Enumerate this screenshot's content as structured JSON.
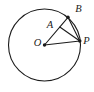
{
  "figure": {
    "type": "geometry-diagram",
    "background": "#ffffff",
    "stroke_color": "#1b1b1b",
    "stroke_width": 1.1,
    "dot_radius": 1.7,
    "circle": {
      "cx": 44.5,
      "cy": 45,
      "r": 36
    },
    "points": {
      "O": {
        "x": 44.5,
        "y": 45,
        "dot": true,
        "label": "O",
        "label_x": 37.5,
        "label_y": 45.5
      },
      "A": {
        "x": 59.8,
        "y": 27,
        "dot": false,
        "label": "A",
        "label_x": 50,
        "label_y": 28
      },
      "B": {
        "x": 68,
        "y": 17.3,
        "dot": true,
        "label": "B",
        "label_x": 78.5,
        "label_y": 12
      },
      "P": {
        "x": 79.8,
        "y": 41,
        "dot": true,
        "label": "P",
        "label_x": 86.5,
        "label_y": 43.5
      }
    },
    "segments": [
      [
        "O",
        "B"
      ],
      [
        "O",
        "P"
      ],
      [
        "A",
        "P"
      ],
      [
        "B",
        "P"
      ]
    ]
  }
}
